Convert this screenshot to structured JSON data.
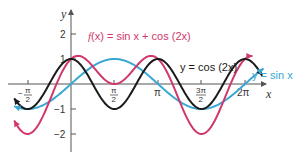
{
  "chart_data": {
    "type": "line",
    "title": "",
    "xlabel": "x",
    "ylabel": "y",
    "xlim": [
      -2.05,
      6.95
    ],
    "ylim": [
      -2.4,
      2.6
    ],
    "grid": false,
    "x_ticks": [
      {
        "value": -1.5708,
        "label_num": "π",
        "label_den": "2",
        "label_sign": "−"
      },
      {
        "value": 1.5708,
        "label_num": "π",
        "label_den": "2",
        "label_sign": ""
      },
      {
        "value": 3.1416,
        "label": "π"
      },
      {
        "value": 4.7124,
        "label_num": "3π",
        "label_den": "2",
        "label_sign": ""
      },
      {
        "value": 6.2832,
        "label": "2π"
      }
    ],
    "y_ticks": [
      {
        "value": 2,
        "label": "2"
      },
      {
        "value": 1,
        "label": "1"
      },
      {
        "value": -1,
        "label": "−1"
      },
      {
        "value": -2,
        "label": "−2"
      }
    ],
    "series": [
      {
        "name": "f(x) = sin x + cos (2x)",
        "function": "sin(x)+cos(2x)",
        "color": "#d0386a",
        "x_range": [
          -2.05,
          6.55
        ]
      },
      {
        "name": "y = cos (2x)",
        "function": "cos(2x)",
        "color": "#1a1a1a",
        "x_range": [
          -2.05,
          6.9
        ]
      },
      {
        "name": "y = sin x",
        "function": "sin(x)",
        "color": "#3ba7d4",
        "x_range": [
          -2.05,
          6.95
        ]
      }
    ],
    "annotations": [
      {
        "text_parts": [
          "f",
          "(x)",
          " = sin ",
          "x",
          " + cos (2",
          "x",
          ")"
        ],
        "color": "#d0386a"
      },
      {
        "text_parts": [
          "y",
          " = cos (2",
          "x",
          ")"
        ],
        "color": "#1a1a1a"
      },
      {
        "text_parts": [
          "y",
          " = sin ",
          "x"
        ],
        "color": "#3ba7d4"
      }
    ],
    "legend": {
      "position": "inline labels"
    }
  },
  "labels": {
    "x_axis": "x",
    "y_axis": "y",
    "f_label_f": "f",
    "f_label_rest": "(x) = sin x + cos (2x)",
    "cos_label": "y = cos (2x)",
    "sin_label": "y = sin x",
    "tick_2": "2",
    "tick_1": "1",
    "tick_m1": "−1",
    "tick_m2": "−2",
    "tick_pi": "π",
    "tick_2pi": "2π",
    "tick_pi_num": "π",
    "tick_3pi_num": "3π",
    "tick_den": "2",
    "tick_minus": "−"
  }
}
